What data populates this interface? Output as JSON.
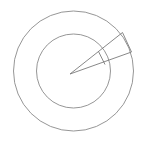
{
  "figure": {
    "type": "geometric-diagram",
    "canvas": {
      "width": 143,
      "height": 146,
      "background": "#ffffff"
    },
    "stroke_color": "#7a7a7a",
    "stroke_width": 0.9,
    "center": {
      "x": 73.5,
      "y": 71.0
    },
    "circles": [
      {
        "name": "outer-circle",
        "cx": 73.5,
        "cy": 71.0,
        "r": 60.0,
        "stroke": "#8a8a8a"
      },
      {
        "name": "inner-circle",
        "cx": 73.5,
        "cy": 71.0,
        "r": 37.0,
        "stroke": "#8a8a8a"
      }
    ],
    "apex": {
      "x": 70.0,
      "y": 74.0
    },
    "rays": [
      {
        "name": "upper-ray",
        "x1": 70.0,
        "y1": 74.0,
        "x2": 122.5,
        "y2": 32.5,
        "angle_deg": -38.3
      },
      {
        "name": "lower-ray",
        "x1": 70.0,
        "y1": 74.0,
        "x2": 131.5,
        "y2": 52.0,
        "angle_deg": -20.1
      }
    ],
    "chords": [
      {
        "name": "inner-chord",
        "x1": 98.5,
        "y1": 51.5,
        "x2": 105.0,
        "y2": 64.5
      },
      {
        "name": "outer-chord",
        "x1": 122.5,
        "y1": 32.5,
        "x2": 131.5,
        "y2": 52.0
      }
    ],
    "labels": []
  }
}
